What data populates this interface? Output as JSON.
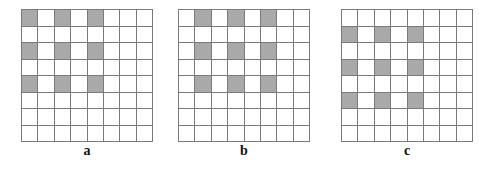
{
  "figure": {
    "rows": 8,
    "cols": 8,
    "shade_color": "#a9a9a9",
    "line_color": "#7a7a7a",
    "panels": [
      {
        "label": "a",
        "x": 21,
        "shaded_rows": [
          0,
          2,
          4
        ],
        "shaded_cols": [
          0,
          2,
          4
        ]
      },
      {
        "label": "b",
        "x": 178,
        "shaded_rows": [
          0,
          2,
          4
        ],
        "shaded_cols": [
          1,
          3,
          5
        ]
      },
      {
        "label": "c",
        "x": 341,
        "shaded_rows": [
          1,
          3,
          5
        ],
        "shaded_cols": [
          0,
          2,
          4
        ]
      }
    ]
  }
}
